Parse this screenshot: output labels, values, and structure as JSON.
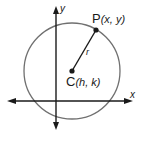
{
  "diagram": {
    "labels": {
      "y_axis": "y",
      "x_axis": "x",
      "point_p_letter": "P",
      "point_p_coords": "(x, y)",
      "center_letter": "C",
      "center_coords": "(h, k)",
      "radius": "r"
    },
    "colors": {
      "axes": "#1a1a1a",
      "circle": "#707070",
      "radius_line": "#1a1a1a",
      "points": "#1a1a1a",
      "background": "#ffffff"
    },
    "geometry": {
      "circle_center": [
        72,
        71
      ],
      "circle_radius": 48,
      "point_p": [
        96,
        30
      ],
      "x_axis_y": 101,
      "y_axis_x": 56
    }
  }
}
